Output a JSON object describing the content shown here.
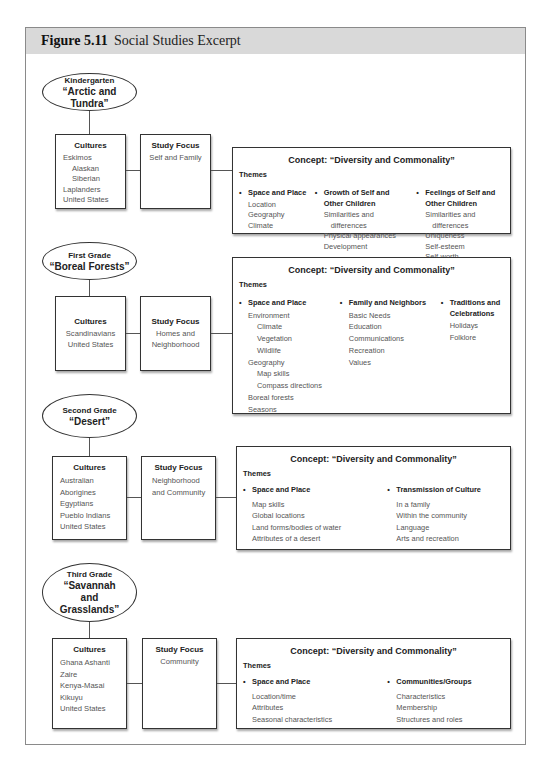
{
  "figure": {
    "number": "Figure 5.11",
    "title": "Social Studies Excerpt"
  },
  "grades": [
    {
      "grade": "Kindergarten",
      "topic": "“Arctic and Tundra”",
      "cultures_label": "Cultures",
      "cultures": [
        "Eskimos",
        "Alaskan",
        "Siberian",
        "Laplanders",
        "United States"
      ],
      "focus_label": "Study Focus",
      "focus": [
        "Self and Family"
      ],
      "concept": "Concept: “Diversity and Commonality”",
      "themes_label": "Themes",
      "themes": [
        {
          "title": "Space and Place",
          "items": [
            "Location",
            "Geography",
            "Climate"
          ]
        },
        {
          "title": "Growth of Self and Other Children",
          "items": [
            "Similarities and",
            "differences",
            "Physical appearances",
            "Development"
          ]
        },
        {
          "title": "Feelings of Self and Other Children",
          "items": [
            "Similarities and",
            "differences",
            "Uniqueness",
            "Self-esteem",
            "Self-worth"
          ]
        }
      ]
    },
    {
      "grade": "First Grade",
      "topic": "“Boreal Forests”",
      "cultures_label": "Cultures",
      "cultures": [
        "Scandinavians",
        "United States"
      ],
      "focus_label": "Study Focus",
      "focus": [
        "Homes and",
        "Neighborhood"
      ],
      "concept": "Concept: “Diversity and Commonality”",
      "themes_label": "Themes",
      "themes": [
        {
          "title": "Space and Place",
          "items": [
            "Environment",
            "Climate",
            "Vegetation",
            "Wildlife",
            "Geography",
            "Map skills",
            "Compass directions",
            "Boreal forests",
            "Seasons"
          ]
        },
        {
          "title": "Family and Neighbors",
          "items": [
            "Basic Needs",
            "Education",
            "Communications",
            "Recreation",
            "Values"
          ]
        },
        {
          "title": "Traditions and Celebrations",
          "items": [
            "Holidays",
            "Folklore"
          ]
        }
      ]
    },
    {
      "grade": "Second Grade",
      "topic": "“Desert”",
      "cultures_label": "Cultures",
      "cultures": [
        "Australian",
        "Aborigines",
        "Egyptians",
        "Pueblo Indians",
        "United States"
      ],
      "focus_label": "Study Focus",
      "focus": [
        "Neighborhood",
        "and Community"
      ],
      "concept": "Concept: “Diversity and Commonality”",
      "themes_label": "Themes",
      "themes": [
        {
          "title": "Space and Place",
          "items": [
            "Map skills",
            "Global locations",
            "Land forms/bodies of water",
            "Attributes of a desert"
          ]
        },
        {
          "title": "Transmission of Culture",
          "items": [
            "In a family",
            "Within the community",
            "Language",
            "Arts and recreation"
          ]
        }
      ]
    },
    {
      "grade": "Third Grade",
      "topic": "“Savannah and Grasslands”",
      "cultures_label": "Cultures",
      "cultures": [
        "Ghana Ashanti",
        "Zaire",
        "Kenya-Masai",
        "Kikuyu",
        "United States"
      ],
      "focus_label": "Study Focus",
      "focus": [
        "Community"
      ],
      "concept": "Concept: “Diversity and Commonality”",
      "themes_label": "Themes",
      "themes": [
        {
          "title": "Space and Place",
          "items": [
            "Location/time",
            "Attributes",
            "Seasonal characteristics"
          ]
        },
        {
          "title": "Communities/Groups",
          "items": [
            "Characteristics",
            "Membership",
            "Structures and roles"
          ]
        }
      ]
    }
  ]
}
